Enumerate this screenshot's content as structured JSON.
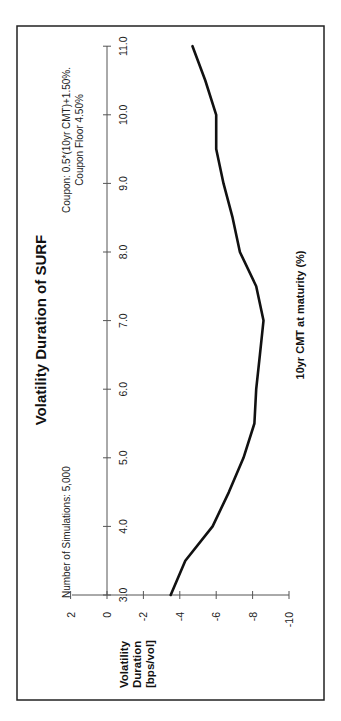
{
  "chart_data": {
    "type": "line",
    "orientation": "rotated 90deg counter-clockwise on page",
    "title": "Volatility Duration of SURF",
    "annotations": [
      "Number of Simulations: 5,000",
      "Coupon: 0.5*(10yr CMT)+1.50%.",
      "Coupon Floor 4.50%"
    ],
    "xlabel": "10yr CMT at maturity (%)",
    "ylabel_lines": [
      "Volatility",
      "Duration",
      "[bps/vol]"
    ],
    "xlim": [
      3.0,
      11.0
    ],
    "ylim": [
      -10,
      2
    ],
    "xticks": [
      "3.0",
      "4.0",
      "5.0",
      "6.0",
      "7.0",
      "8.0",
      "9.0",
      "10.0",
      "11.0"
    ],
    "yticks": [
      "2",
      "0",
      "-2",
      "-4",
      "-6",
      "-8",
      "-10"
    ],
    "grid": false,
    "legend": null,
    "series": [
      {
        "name": "Volatility Duration",
        "x": [
          3.0,
          3.5,
          4.0,
          4.5,
          5.0,
          5.5,
          6.0,
          6.5,
          7.0,
          7.5,
          8.0,
          8.5,
          9.0,
          9.5,
          10.0,
          10.5,
          11.0
        ],
        "values": [
          -3.5,
          -4.3,
          -5.8,
          -6.7,
          -7.5,
          -8.1,
          -8.2,
          -8.4,
          -8.6,
          -8.2,
          -7.3,
          -6.9,
          -6.4,
          -6.0,
          -6.0,
          -5.4,
          -4.7
        ]
      }
    ]
  }
}
